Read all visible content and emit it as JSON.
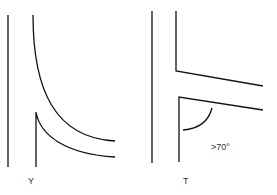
{
  "diagram": {
    "left_junction": {
      "label": "Y",
      "type": "Y-shaped branching"
    },
    "right_junction": {
      "label": "T",
      "type": "T-shaped branching",
      "angle_annotation": ">70°"
    }
  },
  "colors": {
    "stroke": "#111111",
    "background": "#ffffff"
  }
}
